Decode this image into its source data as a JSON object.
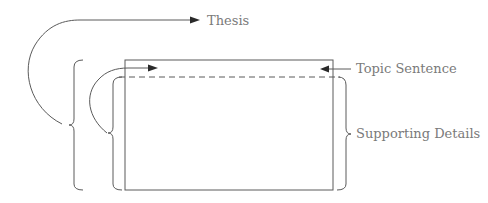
{
  "diagram": {
    "labels": {
      "thesis": "Thesis",
      "topic_sentence": "Topic Sentence",
      "supporting_details": "Supporting Details"
    },
    "colors": {
      "line": "#5a5a5a",
      "arrowhead": "#2a2a2a",
      "text": "#7a7a7a",
      "background": "#ffffff"
    }
  }
}
